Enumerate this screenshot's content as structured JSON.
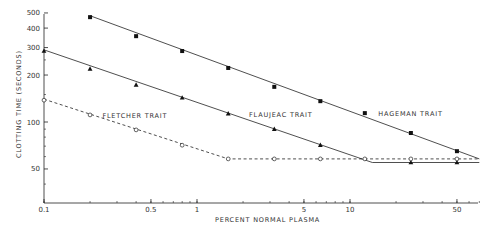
{
  "chart_data": {
    "type": "line",
    "title": "",
    "xlabel": "PERCENT NORMAL PLASMA",
    "ylabel": "CLOTTING TIME (SECONDS)",
    "xscale": "log",
    "yscale": "log",
    "xlim": [
      0.1,
      70
    ],
    "ylim": [
      30,
      520
    ],
    "grid": false,
    "legend_position": "inline labels",
    "x_ticks": [
      {
        "value": 0.1,
        "label": "0.1"
      },
      {
        "value": 0.5,
        "label": "0.5"
      },
      {
        "value": 1,
        "label": "1"
      },
      {
        "value": 5,
        "label": "5"
      },
      {
        "value": 10,
        "label": "10"
      },
      {
        "value": 50,
        "label": "50"
      }
    ],
    "y_ticks": [
      {
        "value": 50,
        "label": "50"
      },
      {
        "value": 100,
        "label": "100"
      },
      {
        "value": 200,
        "label": "200"
      },
      {
        "value": 300,
        "label": "300"
      },
      {
        "value": 400,
        "label": "400"
      },
      {
        "value": 500,
        "label": "500"
      }
    ],
    "series": [
      {
        "name": "HAGEMAN TRAIT",
        "marker": "filled-square",
        "line": "solid",
        "x": [
          0.2,
          0.4,
          0.8,
          1.6,
          3.2,
          6.4,
          12.5,
          25,
          50
        ],
        "values": [
          470,
          355,
          285,
          222,
          168,
          136,
          114,
          85,
          65
        ],
        "fit_line": [
          [
            0.2,
            480
          ],
          [
            70,
            58
          ]
        ]
      },
      {
        "name": "FLAUJEAC TRAIT",
        "marker": "filled-triangle",
        "line": "solid",
        "x": [
          0.1,
          0.2,
          0.4,
          0.8,
          1.6,
          3.2,
          6.4,
          25,
          50
        ],
        "values": [
          285,
          219,
          173,
          143,
          113,
          90,
          71,
          55,
          55
        ],
        "fit_line": [
          [
            0.1,
            290
          ],
          [
            14,
            55
          ],
          [
            70,
            55
          ]
        ]
      },
      {
        "name": "FLETCHER TRAIT",
        "marker": "open-circle",
        "line": "dashed",
        "x": [
          0.1,
          0.2,
          0.4,
          0.8,
          1.6,
          3.2,
          6.4,
          12.5,
          25,
          50
        ],
        "values": [
          138,
          111,
          89,
          71,
          58,
          58,
          58,
          58,
          58,
          58
        ],
        "fit_line": [
          [
            0.1,
            140
          ],
          [
            1.6,
            58
          ],
          [
            70,
            58
          ]
        ]
      }
    ],
    "annotations": [
      {
        "text": "FLETCHER TRAIT",
        "x": 0.22,
        "y": 110
      },
      {
        "text": "FLAUJEAC TRAIT",
        "x": 2.0,
        "y": 112
      },
      {
        "text": "HAGEMAN TRAIT",
        "x": 14,
        "y": 114
      }
    ]
  }
}
